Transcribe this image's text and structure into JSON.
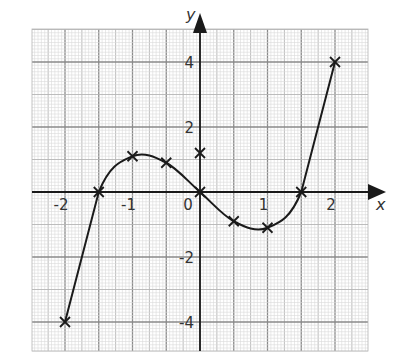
{
  "chart_data": {
    "type": "line",
    "title": "",
    "xlabel": "x",
    "ylabel": "y",
    "xlim": [
      -2.5,
      2.5
    ],
    "ylim": [
      -4.9,
      4.9
    ],
    "grid": true,
    "x_ticks": [
      -2,
      -1,
      0,
      1,
      2
    ],
    "x_tick_labels": [
      "-2",
      "-1",
      "0",
      "1",
      "2"
    ],
    "y_ticks": [
      4,
      2,
      -2,
      -4
    ],
    "y_tick_labels": [
      "4",
      "2",
      "-2",
      "-4"
    ],
    "series": [
      {
        "name": "curve",
        "style": "smooth line through plotted crosses",
        "x": [
          -2,
          -1.5,
          -1,
          -0.5,
          0,
          0.5,
          1,
          1.5,
          2
        ],
        "y": [
          -4,
          0,
          1.1,
          0.9,
          0,
          -0.9,
          -1.1,
          0,
          4
        ]
      }
    ],
    "extra_points": [
      {
        "x": 0,
        "y": 1.2,
        "marker": "cross"
      }
    ],
    "legend": null
  },
  "colors": {
    "curve": "#1a1a1a",
    "axes": "#1a1a1a",
    "major_grid": "#8a8a8a",
    "medium_grid": "#b5b5b5",
    "minor_grid": "#dadada",
    "background": "#ffffff"
  }
}
